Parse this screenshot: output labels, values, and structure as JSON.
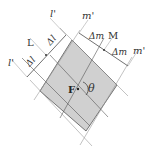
{
  "diagram": {
    "labels": {
      "l_prime_top": "l'",
      "l_prime_bottom": "l'",
      "L": "L",
      "delta_l_1": "Δl",
      "delta_l_2": "Δl",
      "m_prime_top": "m'",
      "m_prime_right": "m'",
      "M": "M",
      "delta_m_1": "Δm",
      "delta_m_2": "Δm",
      "F": "F",
      "theta": "θ"
    },
    "colors": {
      "fill": "#d0d0d0",
      "line": "#444444",
      "guide": "#bbbbbb"
    }
  }
}
